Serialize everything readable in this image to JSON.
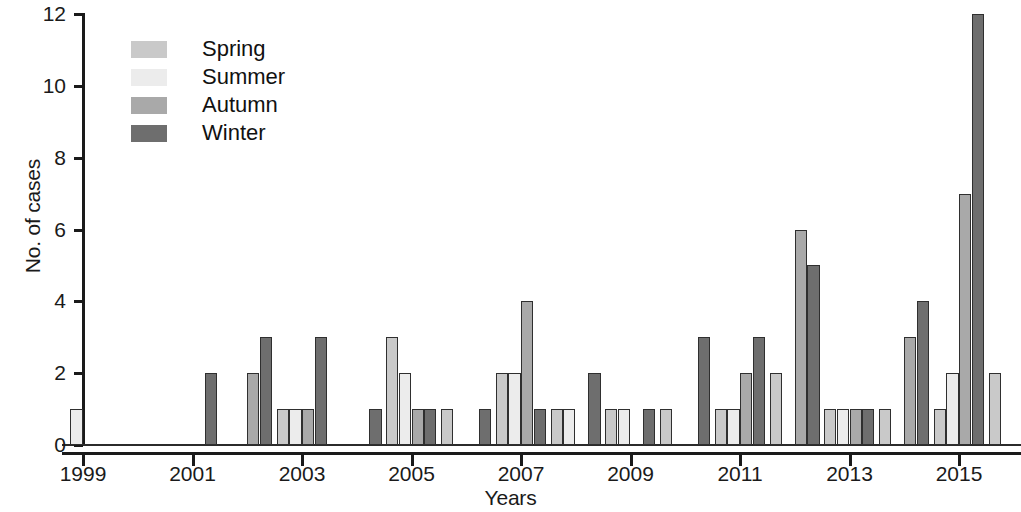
{
  "chart_data": {
    "type": "bar",
    "title": "",
    "xlabel": "Years",
    "ylabel": "No. of cases",
    "ylim": [
      0,
      12
    ],
    "yticks": [
      0,
      2,
      4,
      6,
      8,
      10,
      12
    ],
    "grid": false,
    "legend_position": "top-left",
    "categories": [
      "1999",
      "2000",
      "2001",
      "2002",
      "2003",
      "2004",
      "2005",
      "2006",
      "2007",
      "2008",
      "2009",
      "2010",
      "2011",
      "2012",
      "2013",
      "2014",
      "2015",
      "2016"
    ],
    "xtick_labels": [
      "1999",
      "2001",
      "2003",
      "2005",
      "2007",
      "2009",
      "2011",
      "2013",
      "2015"
    ],
    "series": [
      {
        "name": "Spring",
        "color": "#c9c9c9",
        "values": [
          0,
          0,
          0,
          0,
          1,
          0,
          3,
          1,
          2,
          1,
          1,
          1,
          1,
          2,
          1,
          1,
          1,
          0
        ]
      },
      {
        "name": "Summer",
        "color": "#ececec",
        "values": [
          1,
          0,
          0,
          0,
          1,
          0,
          2,
          0,
          2,
          1,
          1,
          0,
          1,
          0,
          1,
          0,
          2,
          0
        ]
      },
      {
        "name": "Autumn",
        "color": "#a9a9a9",
        "values": [
          0,
          0,
          0,
          2,
          1,
          0,
          1,
          0,
          4,
          0,
          0,
          0,
          2,
          6,
          1,
          3,
          7,
          0
        ]
      },
      {
        "name": "Winter",
        "color": "#6e6e6e",
        "values": [
          0,
          0,
          2,
          3,
          3,
          1,
          1,
          1,
          1,
          2,
          1,
          3,
          3,
          5,
          1,
          4,
          12,
          1
        ]
      }
    ],
    "bars": [
      {
        "year": "1999",
        "season": "Summer",
        "value": 1
      },
      {
        "year": "2001",
        "season": "Winter",
        "value": 2
      },
      {
        "year": "2002",
        "season": "Autumn",
        "value": 2
      },
      {
        "year": "2002",
        "season": "Winter",
        "value": 3
      },
      {
        "year": "2003",
        "season": "Spring",
        "value": 1
      },
      {
        "year": "2003",
        "season": "Summer",
        "value": 1
      },
      {
        "year": "2003",
        "season": "Autumn",
        "value": 1
      },
      {
        "year": "2003",
        "season": "Winter",
        "value": 3
      },
      {
        "year": "2004",
        "season": "Winter",
        "value": 1
      },
      {
        "year": "2005",
        "season": "Spring",
        "value": 3
      },
      {
        "year": "2005",
        "season": "Summer",
        "value": 2
      },
      {
        "year": "2005",
        "season": "Autumn",
        "value": 1
      },
      {
        "year": "2005",
        "season": "Winter",
        "value": 1
      },
      {
        "year": "2006",
        "season": "Spring",
        "value": 1
      },
      {
        "year": "2006",
        "season": "Winter",
        "value": 1
      },
      {
        "year": "2007",
        "season": "Spring",
        "value": 2
      },
      {
        "year": "2007",
        "season": "Summer",
        "value": 2
      },
      {
        "year": "2007",
        "season": "Autumn",
        "value": 4
      },
      {
        "year": "2007",
        "season": "Winter",
        "value": 1
      },
      {
        "year": "2008",
        "season": "Spring",
        "value": 1
      },
      {
        "year": "2008",
        "season": "Summer",
        "value": 1
      },
      {
        "year": "2008",
        "season": "Winter",
        "value": 2
      },
      {
        "year": "2009",
        "season": "Spring",
        "value": 1
      },
      {
        "year": "2009",
        "season": "Summer",
        "value": 1
      },
      {
        "year": "2009",
        "season": "Winter",
        "value": 1
      },
      {
        "year": "2010",
        "season": "Spring",
        "value": 1
      },
      {
        "year": "2010",
        "season": "Winter",
        "value": 3
      },
      {
        "year": "2011",
        "season": "Spring",
        "value": 1
      },
      {
        "year": "2011",
        "season": "Summer",
        "value": 1
      },
      {
        "year": "2011",
        "season": "Autumn",
        "value": 2
      },
      {
        "year": "2011",
        "season": "Winter",
        "value": 3
      },
      {
        "year": "2012",
        "season": "Spring",
        "value": 2
      },
      {
        "year": "2012",
        "season": "Autumn",
        "value": 6
      },
      {
        "year": "2012",
        "season": "Winter",
        "value": 5
      },
      {
        "year": "2013",
        "season": "Spring",
        "value": 1
      },
      {
        "year": "2013",
        "season": "Summer",
        "value": 1
      },
      {
        "year": "2013",
        "season": "Autumn",
        "value": 1
      },
      {
        "year": "2013",
        "season": "Winter",
        "value": 1
      },
      {
        "year": "2014",
        "season": "Spring",
        "value": 1
      },
      {
        "year": "2014",
        "season": "Autumn",
        "value": 3
      },
      {
        "year": "2014",
        "season": "Winter",
        "value": 4
      },
      {
        "year": "2015",
        "season": "Spring",
        "value": 1
      },
      {
        "year": "2015",
        "season": "Summer",
        "value": 2
      },
      {
        "year": "2015",
        "season": "Autumn",
        "value": 7
      },
      {
        "year": "2015",
        "season": "Winter",
        "value": 12
      },
      {
        "year": "2016",
        "season": "Spring",
        "value": 2
      },
      {
        "year": "2016",
        "season": "Winter",
        "value": 1
      }
    ]
  },
  "legend": {
    "items": [
      {
        "label": "Spring",
        "color": "#c9c9c9"
      },
      {
        "label": "Summer",
        "color": "#ececec"
      },
      {
        "label": "Autumn",
        "color": "#a9a9a9"
      },
      {
        "label": "Winter",
        "color": "#6e6e6e"
      }
    ]
  }
}
